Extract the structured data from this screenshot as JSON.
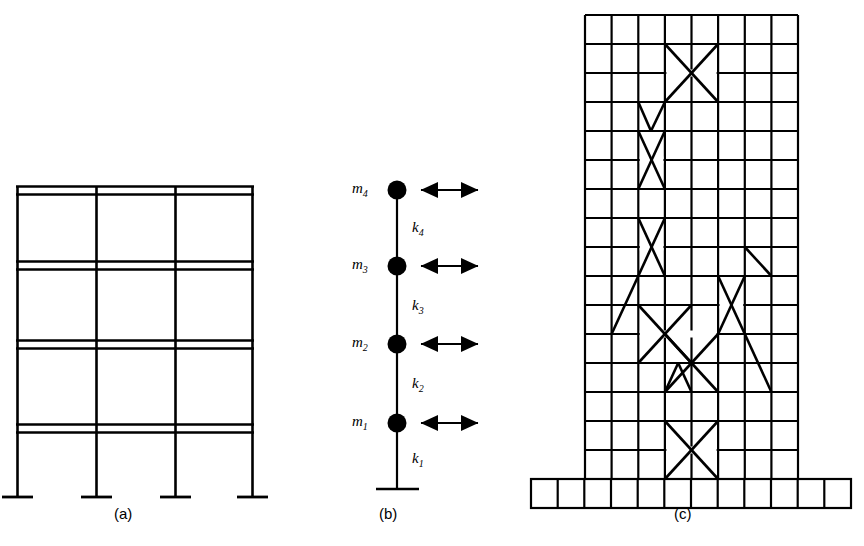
{
  "figure": {
    "line_color": "#000000",
    "background_color": "#ffffff"
  },
  "panels": [
    {
      "id": "a",
      "caption": "(a)",
      "name": "moment-resisting-frame",
      "stories": 4,
      "bays": 3,
      "columns": 4,
      "base_supports": 4
    },
    {
      "id": "b",
      "caption": "(b)",
      "name": "lumped-mass-model",
      "degrees_of_freedom": 4,
      "mass_labels": [
        "m1",
        "m2",
        "m3",
        "m4"
      ],
      "mass_text": [
        "m",
        "m",
        "m",
        "m"
      ],
      "mass_subscripts": [
        "1",
        "2",
        "3",
        "4"
      ],
      "stiffness_labels": [
        "k1",
        "k2",
        "k3",
        "k4"
      ],
      "stiffness_text": [
        "k",
        "k",
        "k",
        "k"
      ],
      "stiffness_subscripts": [
        "1",
        "2",
        "3",
        "4"
      ],
      "arrows": 4,
      "arrow_type": "double-headed-horizontal"
    },
    {
      "id": "c",
      "caption": "(c)",
      "name": "braced-tower-elevation",
      "tower_bays": 8,
      "tower_stories": 16,
      "podium_bays": 12,
      "podium_stories": 1,
      "x_braces": 7
    }
  ],
  "labels": {
    "m1": {
      "symbol": "m",
      "sub": "1"
    },
    "m2": {
      "symbol": "m",
      "sub": "2"
    },
    "m3": {
      "symbol": "m",
      "sub": "3"
    },
    "m4": {
      "symbol": "m",
      "sub": "4"
    },
    "k1": {
      "symbol": "k",
      "sub": "1"
    },
    "k2": {
      "symbol": "k",
      "sub": "2"
    },
    "k3": {
      "symbol": "k",
      "sub": "3"
    },
    "k4": {
      "symbol": "k",
      "sub": "4"
    }
  },
  "captions": {
    "a": "(a)",
    "b": "(b)",
    "c": "(c)"
  }
}
